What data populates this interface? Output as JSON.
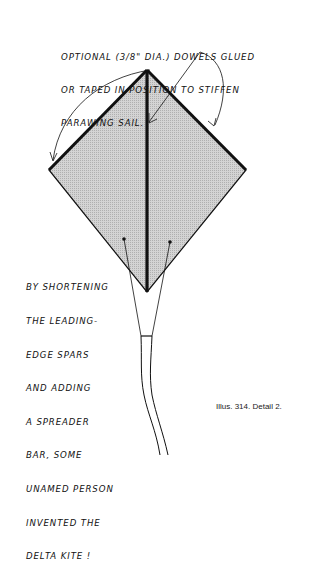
{
  "diagram": {
    "annotations": {
      "top_note": {
        "lines": [
          "OPTIONAL (3/8\" DIA.) DOWELS GLUED",
          "OR TAPED IN POSITION TO STIFFEN",
          "PARAWING SAIL."
        ]
      },
      "side_note": {
        "lines": [
          "BY SHORTENING",
          "THE LEADING-",
          "EDGE SPARS",
          "AND ADDING",
          "A SPREADER",
          "BAR, SOME",
          "UNAMED PERSON",
          "INVENTED THE",
          "DELTA KITE !"
        ]
      }
    },
    "caption": "Illus. 314. Detail 2.",
    "elements": [
      {
        "name": "kite-sail",
        "shape": "diamond",
        "fill": "#c9c9c9",
        "vertices": {
          "top": [
            147,
            70
          ],
          "left": [
            49,
            170
          ],
          "right": [
            246,
            170
          ],
          "bottom": [
            147,
            292
          ]
        }
      },
      {
        "name": "center-spine-dowel",
        "shape": "thick-line"
      },
      {
        "name": "left-leading-edge-dowel",
        "shape": "thick-line"
      },
      {
        "name": "right-leading-edge-dowel",
        "shape": "thick-line"
      },
      {
        "name": "bridle-lines",
        "count": 2
      },
      {
        "name": "tail",
        "shape": "ribbon"
      },
      {
        "name": "pointer-arrows",
        "count": 3
      }
    ],
    "colors": {
      "ink": "#111111",
      "sail_fill": "#c9c9c9",
      "background": "#ffffff"
    }
  }
}
